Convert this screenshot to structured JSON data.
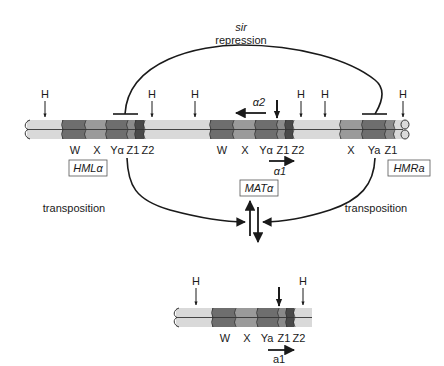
{
  "colors": {
    "chromosome_light": "#d9d9d9",
    "segment_dark": "#6e6e6e",
    "segment_mid": "#9a9a9a",
    "segment_darkest": "#4a4a4a",
    "line": "#1a1a1a"
  },
  "top_arc": {
    "label_line1": "sir",
    "label_line2": "repression"
  },
  "top_chromosome": {
    "h_sites": [
      "H",
      "H",
      "H",
      "H",
      "H",
      "H"
    ],
    "hml": {
      "name": "HMLα",
      "segments": [
        "W",
        "X",
        "Yα",
        "Z1",
        "Z2"
      ]
    },
    "mat": {
      "name": "MATα",
      "segments": [
        "W",
        "X",
        "Yα",
        "Z1",
        "Z2"
      ],
      "transcript_left": "α2",
      "transcript_right": "α1"
    },
    "hmr": {
      "name": "HMRa",
      "segments": [
        "X",
        "Ya",
        "Z1"
      ]
    }
  },
  "transposition": {
    "left_label": "transposition",
    "right_label": "transposition"
  },
  "bottom_chromosome": {
    "h_sites": [
      "H",
      "H"
    ],
    "mat": {
      "name": "MATa",
      "segments": [
        "W",
        "X",
        "Ya",
        "Z1",
        "Z2"
      ],
      "transcript": "a1"
    }
  }
}
